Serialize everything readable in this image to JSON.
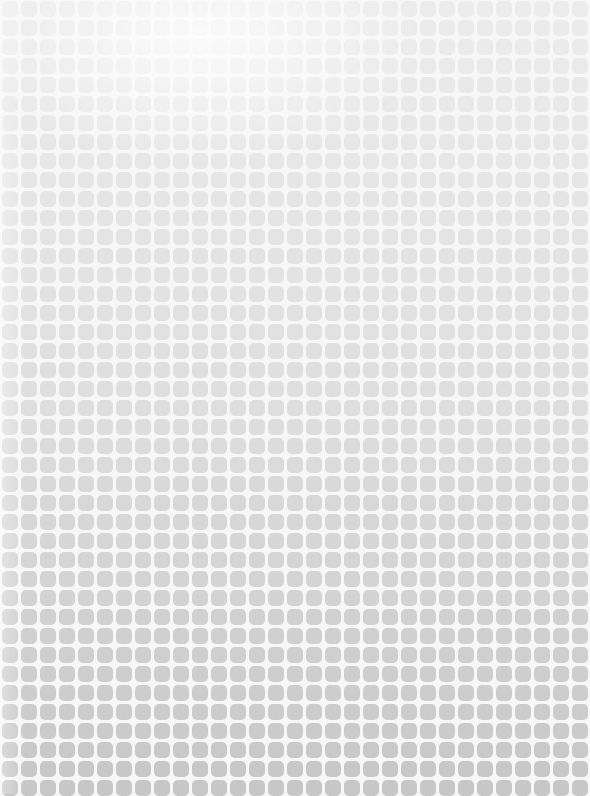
{
  "pattern": {
    "name": "rounded-square-grid",
    "cols": 31,
    "rows": 42,
    "pitch_px": 19,
    "tile_px": 16,
    "offset_x": 2,
    "offset_y": 1,
    "background_color": "#f7f7f7",
    "tile_color_top": "#ececec",
    "tile_color_middle": "#dedede",
    "tile_color_bottom": "#c6c6c6",
    "darker_band_start_row": 21
  }
}
